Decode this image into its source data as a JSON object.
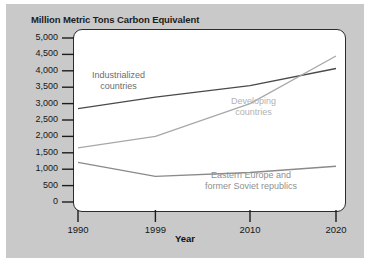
{
  "figure": {
    "title": "Million Metric Tons Carbon Equivalent",
    "background_color": "#c9c9c9",
    "panel_color": "#ffffff"
  },
  "chart_data": {
    "type": "line",
    "title": "Million Metric Tons Carbon Equivalent",
    "xlabel": "Year",
    "ylabel": "Million Metric Tons Carbon Equivalent",
    "xlim": [
      1990,
      2020
    ],
    "ylim": [
      0,
      5000
    ],
    "xticks": [
      1990,
      1999,
      2010,
      2020
    ],
    "xtick_labels": [
      "1990",
      "1999",
      "2010",
      "2020"
    ],
    "yticks": [
      0,
      500,
      1000,
      1500,
      2000,
      2500,
      3000,
      3500,
      4000,
      4500,
      5000
    ],
    "ytick_labels": [
      "0",
      "500",
      "1,000",
      "1,500",
      "2,000",
      "2,500",
      "3,000",
      "3,500",
      "4,000",
      "4,500",
      "5,000"
    ],
    "grid": false,
    "legend": "inline-annotations",
    "series": [
      {
        "name": "Industrialized countries",
        "color": "#4a4a4a",
        "label_color": "#6d6d6d",
        "x": [
          1990,
          1999,
          2010,
          2020
        ],
        "values": [
          2850,
          3200,
          3550,
          4070
        ]
      },
      {
        "name": "Developing countries",
        "color": "#a8a8a8",
        "label_color": "#b2b2b2",
        "x": [
          1990,
          1999,
          2010,
          2020
        ],
        "values": [
          1650,
          2000,
          3000,
          4450
        ]
      },
      {
        "name": "Eastern Europe and former Soviet republics",
        "color": "#8a8a8a",
        "label_color": "#8f8f8f",
        "x": [
          1990,
          1999,
          2010,
          2020
        ],
        "values": [
          1210,
          780,
          900,
          1090
        ]
      }
    ],
    "annotations": [
      {
        "text_line1": "Industrialized",
        "text_line2": "countries"
      },
      {
        "text_line1": "Developing",
        "text_line2": "countries"
      },
      {
        "text_line1": "Eastern Europe and",
        "text_line2": "former Soviet republics"
      }
    ]
  }
}
